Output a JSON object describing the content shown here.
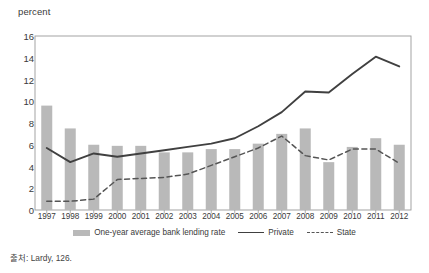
{
  "chart_data": {
    "type": "bar",
    "title": "",
    "subtitle": "",
    "xlabel": "",
    "ylabel": "percent",
    "ylim": [
      0,
      16
    ],
    "yticks": [
      0,
      2,
      4,
      6,
      8,
      10,
      12,
      14,
      16
    ],
    "grid": false,
    "legend_position": "bottom",
    "categories": [
      "1997",
      "1998",
      "1999",
      "2000",
      "2001",
      "2002",
      "2003",
      "2004",
      "2005",
      "2006",
      "2007",
      "2008",
      "2009",
      "2010",
      "2011",
      "2012"
    ],
    "series": [
      {
        "name": "One-year average bank lending rate",
        "type": "bar",
        "color": "#b9b9b9",
        "values": [
          9.6,
          7.5,
          6.0,
          5.9,
          5.9,
          5.3,
          5.3,
          5.6,
          5.6,
          6.1,
          7.0,
          7.5,
          4.4,
          5.8,
          6.6,
          6.0
        ]
      },
      {
        "name": "Private",
        "type": "line",
        "style": "solid",
        "color": "#404040",
        "values": [
          5.7,
          4.4,
          5.2,
          4.9,
          5.2,
          5.5,
          5.8,
          6.1,
          6.6,
          7.7,
          9.0,
          10.9,
          10.8,
          12.5,
          14.1,
          13.2
        ]
      },
      {
        "name": "State",
        "type": "line",
        "style": "dashed",
        "color": "#555555",
        "values": [
          0.8,
          0.8,
          1.0,
          2.8,
          2.9,
          3.0,
          3.3,
          4.1,
          4.9,
          5.7,
          6.8,
          5.0,
          4.6,
          5.6,
          5.6,
          4.3
        ]
      }
    ]
  },
  "axis": {
    "unit_label": "percent"
  },
  "legend": {
    "items": [
      {
        "label": "One-year average bank lending rate",
        "marker": "bar-swatch"
      },
      {
        "label": "Private",
        "marker": "solid-line"
      },
      {
        "label": "State",
        "marker": "dashed-line"
      }
    ]
  },
  "source": {
    "text": "출처: Lardy, 126."
  }
}
